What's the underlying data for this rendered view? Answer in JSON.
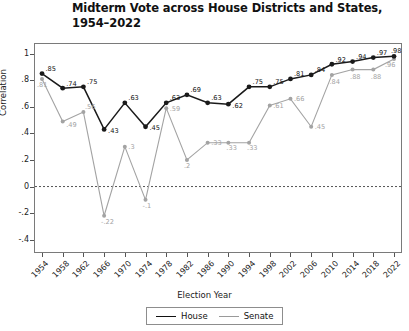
{
  "chart_data": {
    "type": "line",
    "title": "Midterm Vote across House Districts and States, 1954–2022",
    "xlabel": "Election Year",
    "ylabel": "Correlation",
    "ylim": [
      -0.5,
      1.08
    ],
    "yticks": [
      "1",
      ".8",
      ".6",
      ".4",
      ".2",
      "0",
      "-.2",
      "-.4"
    ],
    "ytick_values": [
      1,
      0.8,
      0.6,
      0.4,
      0.2,
      0,
      -0.2,
      -0.4
    ],
    "grid": false,
    "zero_reference_line": true,
    "legend_position": "bottom-center",
    "categories": [
      "1954",
      "1958",
      "1962",
      "1966",
      "1970",
      "1974",
      "1978",
      "1982",
      "1986",
      "1990",
      "1994",
      "1998",
      "2002",
      "2006",
      "2010",
      "2014",
      "2018",
      "2022"
    ],
    "series": [
      {
        "name": "House",
        "color": "#1a1a1a",
        "values": [
          0.85,
          0.74,
          0.75,
          0.43,
          0.63,
          0.45,
          0.63,
          0.69,
          0.63,
          0.62,
          0.75,
          0.75,
          0.81,
          0.84,
          0.92,
          0.94,
          0.97,
          0.98
        ],
        "labels": [
          ".85",
          ".74",
          ".75",
          ".43",
          ".63",
          ".45",
          ".63",
          ".69",
          ".63",
          ".62",
          ".75",
          ".75",
          ".81",
          ".84",
          ".92",
          ".94",
          ".97",
          ".98"
        ]
      },
      {
        "name": "Senate",
        "color": "#a3a3a3",
        "values": [
          0.81,
          0.49,
          0.56,
          -0.22,
          0.3,
          -0.1,
          0.59,
          0.2,
          0.33,
          0.33,
          0.33,
          0.61,
          0.66,
          0.45,
          0.84,
          0.88,
          0.88,
          0.96
        ],
        "labels": [
          ".81",
          ".49",
          ".56",
          "-.22",
          ".3",
          "-.1",
          ".59",
          ".2",
          ".33",
          ".33",
          ".33",
          ".61",
          ".66",
          ".45",
          ".84",
          ".88",
          ".88",
          ".96"
        ]
      }
    ]
  },
  "legend": {
    "house_label": "House",
    "senate_label": "Senate"
  }
}
